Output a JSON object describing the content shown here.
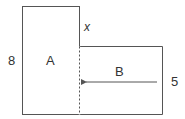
{
  "diagram": {
    "rect_a": {
      "label": "A",
      "height_label": "8"
    },
    "rect_b": {
      "label": "B",
      "height_label": "5"
    },
    "shared_edge_label": "x",
    "colors": {
      "stroke": "#555555",
      "text": "#333333"
    }
  }
}
